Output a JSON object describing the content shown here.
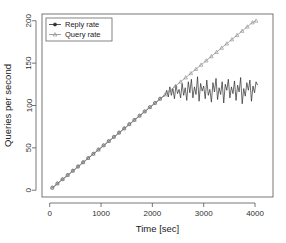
{
  "chart_data": {
    "type": "line",
    "title": "",
    "xlabel": "Time [sec]",
    "ylabel": "Queries per second",
    "xlim": [
      -150,
      4350
    ],
    "ylim": [
      -8,
      208
    ],
    "xticks": [
      0,
      1000,
      2000,
      3000,
      4000
    ],
    "yticks": [
      0,
      50,
      100,
      150,
      200
    ],
    "xticklabels": [
      "0",
      "1000",
      "2000",
      "3000",
      "4000"
    ],
    "yticklabels": [
      "0",
      "50",
      "100",
      "150",
      "200"
    ],
    "grid": false,
    "legend_position": "top-left",
    "series": [
      {
        "name": "Reply rate",
        "color": "#2b2b2b",
        "marker": "circle",
        "x": [
          50,
          100,
          150,
          200,
          250,
          300,
          350,
          400,
          450,
          500,
          550,
          600,
          650,
          700,
          750,
          800,
          850,
          900,
          950,
          1000,
          1050,
          1100,
          1150,
          1200,
          1250,
          1300,
          1350,
          1400,
          1450,
          1500,
          1550,
          1600,
          1650,
          1700,
          1750,
          1800,
          1850,
          1900,
          1950,
          2000,
          2050,
          2100,
          2150,
          2200,
          2250,
          2280,
          2310,
          2340,
          2370,
          2400,
          2430,
          2460,
          2490,
          2520,
          2550,
          2580,
          2610,
          2640,
          2670,
          2700,
          2730,
          2760,
          2790,
          2820,
          2850,
          2880,
          2910,
          2940,
          2970,
          3000,
          3030,
          3060,
          3090,
          3120,
          3150,
          3180,
          3210,
          3240,
          3270,
          3300,
          3330,
          3360,
          3390,
          3420,
          3450,
          3480,
          3510,
          3540,
          3570,
          3600,
          3630,
          3660,
          3690,
          3720,
          3750,
          3780,
          3810,
          3840,
          3870,
          3900,
          3930,
          3960,
          3990,
          4020,
          4050
        ],
        "y": [
          3,
          5,
          8,
          10,
          13,
          15,
          18,
          20,
          23,
          25,
          28,
          30,
          33,
          35,
          38,
          40,
          43,
          45,
          48,
          50,
          53,
          55,
          58,
          60,
          63,
          65,
          68,
          70,
          73,
          75,
          78,
          80,
          83,
          85,
          88,
          90,
          93,
          95,
          98,
          100,
          103,
          105,
          108,
          110,
          112,
          118,
          110,
          122,
          112,
          120,
          108,
          124,
          114,
          119,
          109,
          126,
          112,
          121,
          106,
          128,
          115,
          131,
          109,
          122,
          113,
          134,
          105,
          126,
          117,
          123,
          108,
          130,
          112,
          119,
          104,
          127,
          116,
          132,
          107,
          121,
          113,
          128,
          103,
          125,
          118,
          131,
          109,
          122,
          114,
          129,
          106,
          124,
          116,
          133,
          102,
          120,
          111,
          127,
          118,
          130,
          105,
          123,
          115,
          128,
          124
        ]
      },
      {
        "name": "Query rate",
        "color": "#8a8a8a",
        "marker": "triangle",
        "x": [
          50,
          150,
          250,
          350,
          450,
          550,
          650,
          750,
          850,
          950,
          1050,
          1150,
          1250,
          1350,
          1450,
          1550,
          1650,
          1750,
          1850,
          1950,
          2050,
          2150,
          2250,
          2350,
          2450,
          2550,
          2650,
          2750,
          2850,
          2950,
          3050,
          3150,
          3250,
          3350,
          3450,
          3550,
          3650,
          3750,
          3850,
          3950,
          4020
        ],
        "y": [
          3,
          8,
          13,
          18,
          23,
          28,
          33,
          38,
          43,
          48,
          53,
          58,
          63,
          68,
          73,
          78,
          83,
          88,
          93,
          98,
          103,
          108,
          113,
          118,
          123,
          128,
          133,
          138,
          143,
          148,
          153,
          158,
          163,
          168,
          173,
          178,
          183,
          188,
          193,
          198,
          200
        ]
      }
    ]
  },
  "plot": {
    "frame_left": 42,
    "frame_right": 273,
    "frame_top": 14,
    "frame_bottom": 197
  }
}
